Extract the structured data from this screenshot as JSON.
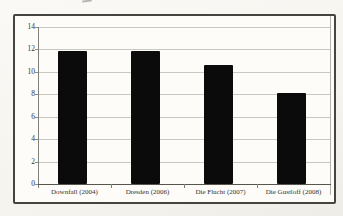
{
  "chart_data": {
    "type": "bar",
    "title": "",
    "xlabel": "",
    "ylabel": "",
    "categories": [
      "Downfall (2004)",
      "Dresden (2006)",
      "Die Flucht (2007)",
      "Die Gustloff (2008)"
    ],
    "values": [
      11.9,
      11.9,
      10.6,
      8.1
    ],
    "ylim": [
      0,
      14
    ],
    "yticks": [
      0,
      2,
      4,
      6,
      8,
      10,
      12,
      14
    ],
    "grid": true,
    "legend_position": "none",
    "bar_color": "#0b0b0b"
  }
}
